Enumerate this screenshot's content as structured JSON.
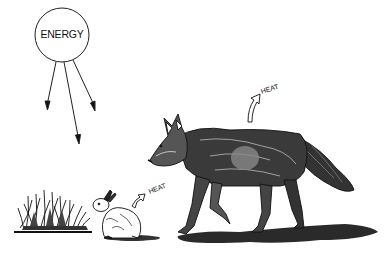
{
  "diagram": {
    "energy_source": {
      "label": "ENERGY",
      "shape": "circle",
      "arrows": 3
    },
    "heat_labels": [
      {
        "id": "wolf-heat",
        "label": "HEAT",
        "attached_to": "coyote"
      },
      {
        "id": "rabbit-heat",
        "label": "HEAT",
        "attached_to": "rabbit"
      }
    ],
    "organisms": [
      {
        "id": "grass",
        "name": "grass",
        "role": "producer"
      },
      {
        "id": "rabbit",
        "name": "rabbit",
        "role": "primary consumer"
      },
      {
        "id": "coyote",
        "name": "coyote",
        "role": "secondary consumer"
      }
    ],
    "colors": {
      "ink": "#111111",
      "background": "#ffffff",
      "shadow": "#2a2a2a"
    }
  }
}
